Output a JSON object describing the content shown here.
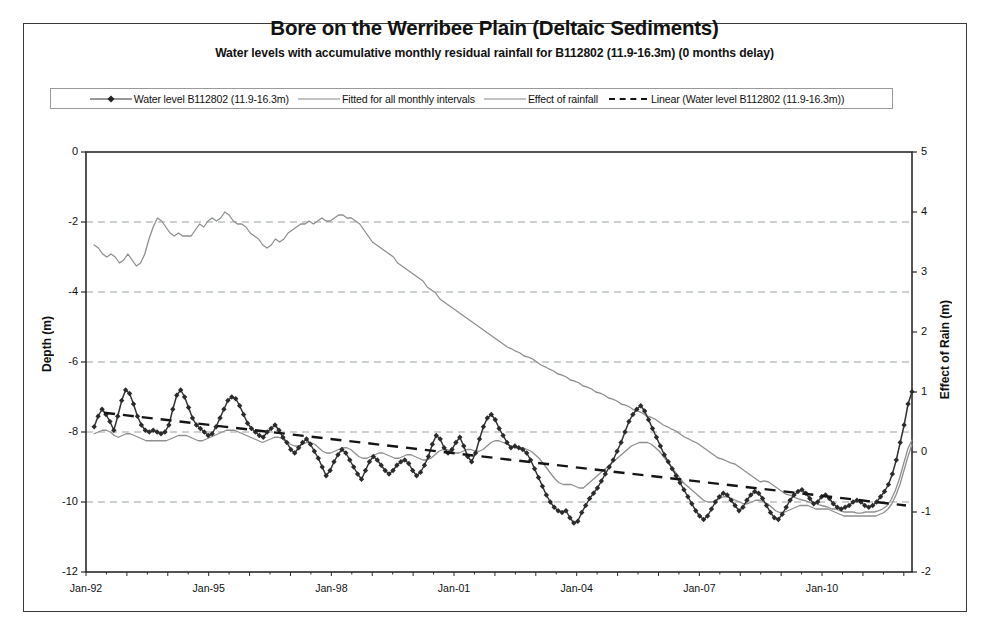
{
  "scan_ghost_text": "",
  "chart_data": {
    "type": "line",
    "title": "Bore on the Werribee Plain (Deltaic Sediments)",
    "subtitle": "Water levels with accumulative monthly residual rainfall for B112802 (11.9-16.3m) (0 months delay)",
    "xlabel": "",
    "ylabel": "Depth (m)",
    "y2label": "Effect of Rain (m)",
    "ylim": [
      -12,
      0
    ],
    "y2lim": [
      -2,
      5
    ],
    "xlim": [
      "Jan-92",
      "Jan-12"
    ],
    "grid": true,
    "legend_position": "top",
    "y_ticks": [
      "0",
      "-2",
      "-4",
      "-6",
      "-8",
      "-10",
      "-12"
    ],
    "y_tick_values": [
      0,
      -2,
      -4,
      -6,
      -8,
      -10,
      -12
    ],
    "y2_ticks": [
      "5",
      "4",
      "3",
      "2",
      "1",
      "0",
      "-1",
      "-2"
    ],
    "y2_tick_values": [
      5,
      4,
      3,
      2,
      1,
      0,
      -1,
      -2
    ],
    "x_ticks": [
      "Jan-92",
      "Jan-95",
      "Jan-98",
      "Jan-01",
      "Jan-04",
      "Jan-07",
      "Jan-10"
    ],
    "x_tick_years": [
      1992,
      1995,
      1998,
      2001,
      2004,
      2007,
      2010
    ],
    "series": [
      {
        "name": "Water level B112802 (11.9-16.3m)",
        "axis": "left",
        "style": "line-marker",
        "color": "#333333",
        "marker": "diamond",
        "x_start_year": 1992.2,
        "x_step_years": 0.1667,
        "values": [
          -7.85,
          -7.55,
          -7.35,
          -7.5,
          -7.7,
          -7.95,
          -7.55,
          -7.1,
          -6.8,
          -6.9,
          -7.2,
          -7.55,
          -7.8,
          -7.95,
          -8.0,
          -7.95,
          -8.0,
          -8.05,
          -8.0,
          -7.8,
          -7.35,
          -6.95,
          -6.8,
          -7.0,
          -7.3,
          -7.6,
          -7.8,
          -7.9,
          -8.0,
          -8.1,
          -8.05,
          -7.85,
          -7.6,
          -7.35,
          -7.1,
          -7.0,
          -7.05,
          -7.25,
          -7.5,
          -7.75,
          -7.9,
          -8.0,
          -8.1,
          -8.15,
          -8.0,
          -7.9,
          -7.8,
          -7.95,
          -8.15,
          -8.3,
          -8.5,
          -8.6,
          -8.45,
          -8.3,
          -8.2,
          -8.35,
          -8.55,
          -8.75,
          -9.0,
          -9.25,
          -9.1,
          -8.85,
          -8.65,
          -8.5,
          -8.6,
          -8.8,
          -9.0,
          -9.2,
          -9.35,
          -9.1,
          -8.85,
          -8.7,
          -8.8,
          -8.95,
          -9.1,
          -9.2,
          -9.1,
          -8.95,
          -8.85,
          -8.8,
          -8.9,
          -9.1,
          -9.25,
          -9.15,
          -8.95,
          -8.7,
          -8.35,
          -8.1,
          -8.2,
          -8.45,
          -8.6,
          -8.5,
          -8.3,
          -8.15,
          -8.4,
          -8.7,
          -8.85,
          -8.6,
          -8.2,
          -7.85,
          -7.6,
          -7.5,
          -7.65,
          -7.9,
          -8.1,
          -8.3,
          -8.45,
          -8.4,
          -8.45,
          -8.5,
          -8.6,
          -8.8,
          -9.05,
          -9.3,
          -9.55,
          -9.8,
          -10.0,
          -10.15,
          -10.25,
          -10.3,
          -10.25,
          -10.45,
          -10.6,
          -10.55,
          -10.3,
          -10.1,
          -9.9,
          -9.75,
          -9.6,
          -9.4,
          -9.2,
          -9.0,
          -8.8,
          -8.55,
          -8.3,
          -8.0,
          -7.7,
          -7.5,
          -7.35,
          -7.25,
          -7.4,
          -7.65,
          -7.9,
          -8.15,
          -8.4,
          -8.65,
          -8.85,
          -9.05,
          -9.25,
          -9.45,
          -9.65,
          -9.85,
          -10.05,
          -10.25,
          -10.4,
          -10.5,
          -10.4,
          -10.2,
          -10.0,
          -9.85,
          -9.75,
          -9.8,
          -9.95,
          -10.1,
          -10.25,
          -10.15,
          -9.95,
          -9.8,
          -9.7,
          -9.75,
          -9.9,
          -10.1,
          -10.3,
          -10.45,
          -10.5,
          -10.35,
          -10.15,
          -9.95,
          -9.8,
          -9.7,
          -9.65,
          -9.75,
          -9.9,
          -10.05,
          -10.0,
          -9.85,
          -9.8,
          -9.9,
          -10.05,
          -10.15,
          -10.2,
          -10.15,
          -10.1,
          -10.0,
          -9.95,
          -10.0,
          -10.1,
          -10.15,
          -10.1,
          -10.0,
          -9.85,
          -9.7,
          -9.5,
          -9.2,
          -8.8,
          -8.3,
          -7.8,
          -7.2,
          -6.85
        ]
      },
      {
        "name": "Fitted for all monthly intervals",
        "axis": "left",
        "style": "line",
        "color": "#8f8f8f",
        "values": [
          -8.05,
          -8.0,
          -7.95,
          -7.95,
          -8.0,
          -8.1,
          -8.15,
          -8.1,
          -8.05,
          -8.05,
          -8.1,
          -8.15,
          -8.2,
          -8.25,
          -8.25,
          -8.25,
          -8.25,
          -8.25,
          -8.25,
          -8.2,
          -8.15,
          -8.1,
          -8.1,
          -8.1,
          -8.15,
          -8.2,
          -8.25,
          -8.25,
          -8.2,
          -8.15,
          -8.1,
          -8.05,
          -8.0,
          -7.95,
          -7.95,
          -7.95,
          -8.0,
          -8.05,
          -8.1,
          -8.15,
          -8.2,
          -8.25,
          -8.3,
          -8.25,
          -8.2,
          -8.15,
          -8.15,
          -8.2,
          -8.3,
          -8.35,
          -8.4,
          -8.4,
          -8.35,
          -8.3,
          -8.3,
          -8.35,
          -8.45,
          -8.55,
          -8.6,
          -8.6,
          -8.55,
          -8.5,
          -8.45,
          -8.45,
          -8.5,
          -8.6,
          -8.7,
          -8.75,
          -8.75,
          -8.7,
          -8.65,
          -8.6,
          -8.6,
          -8.65,
          -8.7,
          -8.75,
          -8.75,
          -8.7,
          -8.65,
          -8.65,
          -8.7,
          -8.75,
          -8.8,
          -8.8,
          -8.75,
          -8.65,
          -8.55,
          -8.5,
          -8.5,
          -8.55,
          -8.6,
          -8.6,
          -8.55,
          -8.5,
          -8.5,
          -8.55,
          -8.55,
          -8.5,
          -8.4,
          -8.3,
          -8.25,
          -8.25,
          -8.3,
          -8.35,
          -8.4,
          -8.45,
          -8.45,
          -8.45,
          -8.5,
          -8.55,
          -8.65,
          -8.75,
          -8.9,
          -9.05,
          -9.2,
          -9.35,
          -9.45,
          -9.5,
          -9.5,
          -9.5,
          -9.55,
          -9.6,
          -9.6,
          -9.5,
          -9.4,
          -9.3,
          -9.2,
          -9.1,
          -9.0,
          -8.9,
          -8.8,
          -8.7,
          -8.6,
          -8.5,
          -8.4,
          -8.35,
          -8.3,
          -8.3,
          -8.3,
          -8.35,
          -8.45,
          -8.55,
          -8.7,
          -8.85,
          -9.0,
          -9.15,
          -9.3,
          -9.45,
          -9.55,
          -9.65,
          -9.75,
          -9.85,
          -9.95,
          -10.0,
          -10.0,
          -9.95,
          -9.9,
          -9.85,
          -9.85,
          -9.9,
          -9.95,
          -10.0,
          -10.05,
          -10.05,
          -10.0,
          -9.95,
          -9.95,
          -10.0,
          -10.05,
          -10.15,
          -10.25,
          -10.3,
          -10.3,
          -10.25,
          -10.2,
          -10.15,
          -10.1,
          -10.1,
          -10.1,
          -10.15,
          -10.2,
          -10.2,
          -10.2,
          -10.2,
          -10.25,
          -10.3,
          -10.35,
          -10.4,
          -10.4,
          -10.4,
          -10.4,
          -10.4,
          -10.4,
          -10.4,
          -10.4,
          -10.4,
          -10.35,
          -10.3,
          -10.2,
          -10.05,
          -9.8,
          -9.5,
          -9.1,
          -8.7,
          -8.35
        ]
      },
      {
        "name": "Effect of rainfall",
        "axis": "right",
        "style": "line",
        "color": "#8f8f8f",
        "values_right_axis": [
          3.45,
          3.4,
          3.3,
          3.25,
          3.3,
          3.25,
          3.15,
          3.2,
          3.3,
          3.2,
          3.1,
          3.15,
          3.3,
          3.55,
          3.75,
          3.9,
          3.85,
          3.75,
          3.65,
          3.6,
          3.65,
          3.6,
          3.6,
          3.6,
          3.7,
          3.8,
          3.75,
          3.85,
          3.9,
          3.85,
          3.9,
          4.0,
          3.95,
          3.85,
          3.8,
          3.8,
          3.75,
          3.65,
          3.6,
          3.55,
          3.45,
          3.4,
          3.45,
          3.55,
          3.5,
          3.55,
          3.65,
          3.7,
          3.75,
          3.8,
          3.8,
          3.85,
          3.8,
          3.85,
          3.9,
          3.85,
          3.85,
          3.9,
          3.95,
          3.95,
          3.9,
          3.9,
          3.85,
          3.8,
          3.7,
          3.6,
          3.5,
          3.45,
          3.4,
          3.35,
          3.3,
          3.25,
          3.15,
          3.1,
          3.05,
          3.0,
          2.95,
          2.9,
          2.85,
          2.75,
          2.7,
          2.65,
          2.55,
          2.5,
          2.45,
          2.4,
          2.35,
          2.3,
          2.25,
          2.2,
          2.15,
          2.1,
          2.05,
          2.0,
          1.95,
          1.9,
          1.85,
          1.8,
          1.75,
          1.72,
          1.68,
          1.65,
          1.6,
          1.58,
          1.55,
          1.5,
          1.45,
          1.42,
          1.38,
          1.35,
          1.3,
          1.28,
          1.25,
          1.2,
          1.18,
          1.15,
          1.1,
          1.08,
          1.05,
          1.0,
          0.98,
          0.95,
          0.9,
          0.88,
          0.85,
          0.8,
          0.78,
          0.75,
          0.7,
          0.68,
          0.65,
          0.6,
          0.58,
          0.55,
          0.5,
          0.45,
          0.42,
          0.38,
          0.35,
          0.3,
          0.25,
          0.22,
          0.18,
          0.15,
          0.1,
          0.05,
          0.0,
          -0.05,
          -0.1,
          -0.12,
          -0.15,
          -0.18,
          -0.2,
          -0.25,
          -0.3,
          -0.35,
          -0.4,
          -0.45,
          -0.5,
          -0.48,
          -0.5,
          -0.55,
          -0.6,
          -0.65,
          -0.7,
          -0.72,
          -0.75,
          -0.78,
          -0.8,
          -0.82,
          -0.85,
          -0.85,
          -0.88,
          -0.9,
          -0.92,
          -0.95,
          -0.95,
          -0.98,
          -1.0,
          -1.0,
          -1.0,
          -1.02,
          -1.02,
          -1.0,
          -1.0,
          -1.0,
          -0.98,
          -0.95,
          -0.9,
          -0.8,
          -0.65,
          -0.45,
          -0.2,
          0.05,
          0.2
        ]
      },
      {
        "name": "Linear (Water level B112802 (11.9-16.3m))",
        "axis": "left",
        "style": "dashed-trend",
        "color": "#151515",
        "trend_start": -7.45,
        "trend_end": -10.1
      }
    ]
  },
  "legend": {
    "items": [
      {
        "label": "Water level B112802 (11.9-16.3m)",
        "key": "line-marker"
      },
      {
        "label": "Fitted for all monthly intervals",
        "key": "line-light"
      },
      {
        "label": "Effect of rainfall",
        "key": "line-light"
      },
      {
        "label": "Linear (Water level B112802 (11.9-16.3m))",
        "key": "dashed"
      }
    ]
  }
}
